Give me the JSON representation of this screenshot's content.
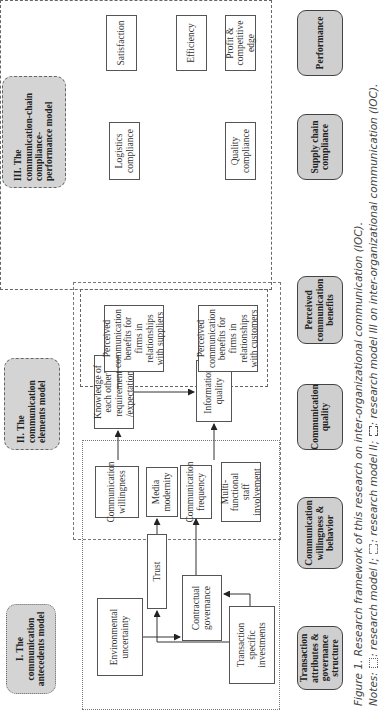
{
  "headers": {
    "model1": "I. The communication antecedents model",
    "model2": "II. The communication elements model",
    "model3": "III. The communication-chain compliance-performance model"
  },
  "antecedents": {
    "environmental_uncertainty": "Environmental uncertainty",
    "trust": "Trust",
    "contractual_governance": "Contractual governance",
    "transaction_specific_investments": "Transaction specific investments"
  },
  "elements": {
    "communication_willingness": "Communication willingness",
    "media_modernity": "Media modernity",
    "communication_frequency": "Communication frequency",
    "multi_functional_staff": "Multi-functional staff involvement",
    "knowledge_expectations": "Knowledge of each other' requirements /expectations",
    "information_quality": "Information quality"
  },
  "benefits": {
    "suppliers": "Perceived communication benefits for firms in relationships with suppliers",
    "customers": "Perceived communication benefits for firms in relationships with customers"
  },
  "compliance": {
    "logistics": "Logistics compliance",
    "quality": "Quality compliance"
  },
  "performance": {
    "satisfaction": "Satisfaction",
    "efficiency": "Efficiency",
    "profit": "Profit & competitive edge"
  },
  "chain": [
    "Transaction attributes & governance structure",
    "Communication willingness & behavior",
    "Communication quality",
    "Perceived communication benefits",
    "Supply chain compliance",
    "Performance"
  ],
  "caption": {
    "figure": "Figure 1. Research framework of this research on inter-organizational communication (IOC).",
    "notes_prefix": "Notes:",
    "note1": ": research model I;",
    "note2": ": research model II;",
    "note3": ": research model III on inter-organizational communication (IOC)."
  }
}
